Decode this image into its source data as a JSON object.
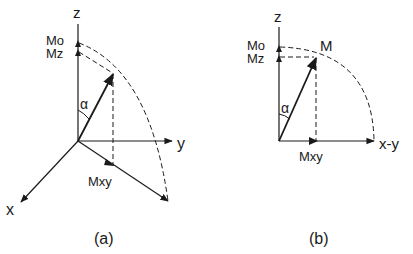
{
  "figure": {
    "panel_a": {
      "caption": "(a)",
      "axis_z_label": "z",
      "axis_y_label": "y",
      "axis_x_label": "x",
      "mo_label": "Mo",
      "mz_label": "Mz",
      "mxy_label": "Mxy",
      "angle_label": "α"
    },
    "panel_b": {
      "caption": "(b)",
      "axis_z_label": "z",
      "axis_xy_label": "x-y",
      "mo_label": "Mo",
      "mz_label": "Mz",
      "m_label": "M",
      "mxy_label": "Mxy",
      "angle_label": "α"
    }
  },
  "colors": {
    "ink": "#1a1a1a",
    "background": "#ffffff"
  }
}
